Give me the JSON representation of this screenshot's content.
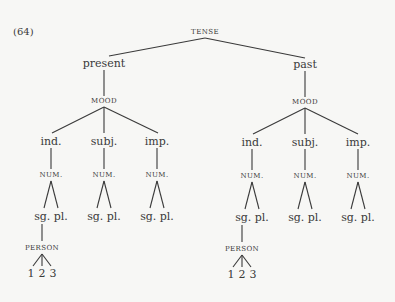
{
  "example_number": "(64)",
  "tree": {
    "root": "TENSE",
    "branches": [
      {
        "label": "present",
        "mood_label": "MOOD",
        "moods": [
          {
            "label": "ind.",
            "num_label": "NUM.",
            "leaves": "sg. pl.",
            "person_label": "PERSON",
            "persons": [
              "1",
              "2",
              "3"
            ]
          },
          {
            "label": "subj.",
            "num_label": "NUM.",
            "leaves": "sg. pl."
          },
          {
            "label": "imp.",
            "num_label": "NUM.",
            "leaves": "sg. pl."
          }
        ]
      },
      {
        "label": "past",
        "mood_label": "MOOD",
        "moods": [
          {
            "label": "ind.",
            "num_label": "NUM.",
            "leaves": "sg. pl.",
            "person_label": "PERSON",
            "persons": [
              "1",
              "2",
              "3"
            ]
          },
          {
            "label": "subj.",
            "num_label": "NUM.",
            "leaves": "sg. pl."
          },
          {
            "label": "imp.",
            "num_label": "NUM.",
            "leaves": "sg. pl."
          }
        ]
      }
    ]
  }
}
